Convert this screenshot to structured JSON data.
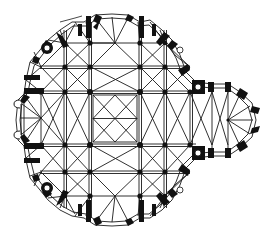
{
  "diagram": {
    "type": "architectural-floor-plan",
    "colors": {
      "ink": "#111111",
      "background": "#ffffff",
      "wall_hatch": "#e6e6e6"
    },
    "grid": {
      "columns_x": [
        41,
        65,
        90,
        140,
        165,
        190
      ],
      "rows_y": [
        43,
        67,
        92,
        145,
        172,
        196
      ]
    },
    "central_crossing": {
      "x": 90,
      "y": 92,
      "width": 50,
      "height": 53
    },
    "east_apse": {
      "center_x": 220,
      "center_y": 120,
      "radius": 36
    },
    "stair_towers": [
      {
        "x": 46,
        "y": 48
      },
      {
        "x": 198,
        "y": 87
      },
      {
        "x": 198,
        "y": 153
      },
      {
        "x": 46,
        "y": 187
      }
    ],
    "labels": []
  }
}
